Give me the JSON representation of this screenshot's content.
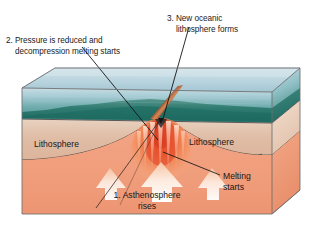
{
  "figure": {
    "domain_note": "cutaway block diagram of oceanic lithosphere and rising asthenosphere"
  },
  "callouts": {
    "pressure": {
      "line1": "2. Pressure is reduced and",
      "line2": "decompression melting starts"
    },
    "new_lithosphere": {
      "line1": "3. New oceanic",
      "line2": "lithosphere forms"
    }
  },
  "block_labels": {
    "lithosphere_left": "Lithosphere",
    "lithosphere_right": "Lithosphere",
    "melting_starts": {
      "line1": "Melting",
      "line2": "starts"
    },
    "asthenosphere": {
      "line1": "1. Asthenosphere",
      "line2": "rises"
    }
  },
  "colors": {
    "water_surface_top": "#c4dbe4",
    "water_surface_bottom": "#9fc6d6",
    "water_body_top": "#b6d3da",
    "water_body_bottom": "#3f8a82",
    "seafloor_far": "#2f7a6e",
    "seafloor_near": "#1f6f66",
    "lithosphere_front": "#dfb9a2",
    "lithosphere_side": "#e6c6ae",
    "asthenosphere_front": "#f09e7b",
    "asthenosphere_side": "#ef9f7c",
    "magma_hot": "#e0452a",
    "magma_warm": "#f07a48",
    "arrow_fill": "#fdf0e6",
    "ridge_crest": "#b4663f",
    "leader_line": "#141414",
    "text": "#1a1a1a",
    "outline": "#5a5a5a"
  },
  "icons": {
    "leader_pressure": "leader-line-icon",
    "leader_newlitho": "leader-line-icon",
    "leader_melting": "leader-line-icon",
    "arrows": "upward-arrow-icon"
  }
}
